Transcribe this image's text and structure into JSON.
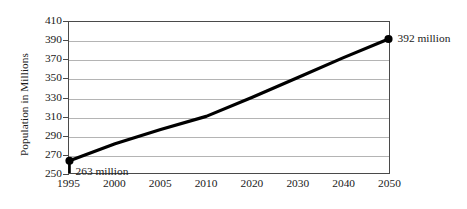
{
  "chart_data": {
    "type": "line",
    "title": "",
    "subtitle": "",
    "xlabel": "",
    "ylabel": "Population in Millions",
    "categories": [
      "1995",
      "2000",
      "2005",
      "2010",
      "2020",
      "2030",
      "2040",
      "2050"
    ],
    "x_tick_labels": [
      "1995",
      "2000",
      "2005",
      "2010",
      "2020",
      "2030",
      "2040",
      "2050"
    ],
    "y_tick_labels": [
      "250",
      "270",
      "290",
      "310",
      "330",
      "350",
      "370",
      "390",
      "410"
    ],
    "y_tick_values": [
      250,
      270,
      290,
      310,
      330,
      350,
      370,
      390,
      410
    ],
    "ylim": [
      250,
      410
    ],
    "grid": "horizontal",
    "legend": "none",
    "series": [
      {
        "name": "Population",
        "values": [
          263,
          281,
          296,
          310,
          330,
          351,
          372,
          392
        ]
      }
    ],
    "annotations": [
      {
        "name": "start-point-label",
        "text": "263 million",
        "category": "1995",
        "value": 263
      },
      {
        "name": "end-point-label",
        "text": "392 million",
        "category": "2050",
        "value": 392
      }
    ],
    "markers": [
      {
        "category": "1995",
        "value": 263
      },
      {
        "category": "2050",
        "value": 392
      }
    ],
    "colors": {
      "line": "#000000",
      "marker": "#000000",
      "gridline": "#b4b4b4",
      "axis": "#4a4a4a",
      "background": "#ffffff",
      "text": "#1a1a1a"
    }
  }
}
